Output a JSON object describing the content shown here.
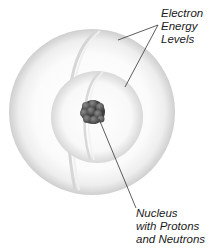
{
  "diagram": {
    "labels": {
      "electron_energy_levels": [
        "Electron",
        "Energy",
        "Levels"
      ],
      "nucleus": [
        "Nucleus",
        "with Protons",
        "and Neutrons"
      ]
    },
    "colors": {
      "shell_light": "#fafafa",
      "shell_shadow": "#d4d4d4",
      "nucleus_particle": "#6a6a6a",
      "nucleus_dark": "#3a3a3a",
      "leader_line": "#333333",
      "text": "#1a1a1a"
    }
  }
}
